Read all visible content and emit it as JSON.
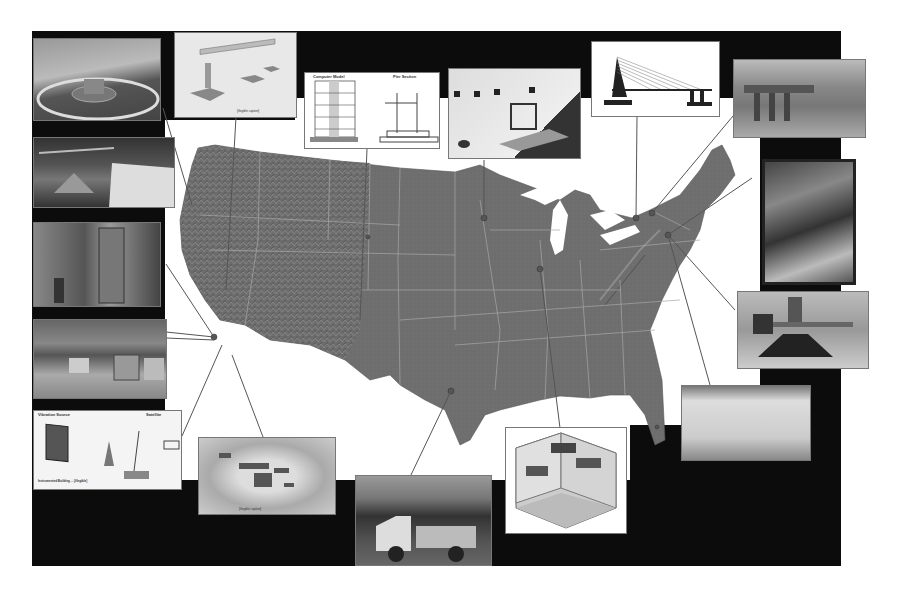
{
  "figure": {
    "type": "map-with-callouts",
    "colors": {
      "frame_background": "#0c0c0c",
      "map_land": "#6e6e6e",
      "state_borders": "#a8a8a8",
      "water_background": "#ffffff",
      "leader_lines": "#555555"
    }
  },
  "insets": [
    {
      "id": "tl-1",
      "kind": "photo",
      "description": "circular shake table / centrifuge facility",
      "label": ""
    },
    {
      "id": "tl-2",
      "kind": "diagram",
      "description": "bridge model on multiple shake tables",
      "label": "[illegible caption]"
    },
    {
      "id": "t-3",
      "kind": "diagram",
      "description": "Computer Model / Pier Section schematic",
      "label_left": "Computer Model",
      "label_right": "Pier Section"
    },
    {
      "id": "t-4",
      "kind": "diagram",
      "description": "reaction wall lab layout with test frame",
      "label": "[illegible caption]"
    },
    {
      "id": "t-5",
      "kind": "diagram",
      "description": "cable-stayed bridge elevation",
      "label": ""
    },
    {
      "id": "tr-6",
      "kind": "photo",
      "description": "structural test frame in laboratory",
      "label": ""
    },
    {
      "id": "r-7",
      "kind": "photo",
      "description": "large-scale lab specimen, overhead view",
      "label": ""
    },
    {
      "id": "r-8",
      "kind": "photo",
      "description": "actuator test rig",
      "label": ""
    },
    {
      "id": "r-9",
      "kind": "photo",
      "description": "strong wall with anchor grid",
      "label": ""
    },
    {
      "id": "l-10",
      "kind": "photo",
      "description": "centrifuge rotor arm",
      "label": ""
    },
    {
      "id": "l-11",
      "kind": "photo",
      "description": "test specimen in lab bay",
      "label": ""
    },
    {
      "id": "l-12",
      "kind": "photo",
      "description": "field test site with structures",
      "label": ""
    },
    {
      "id": "bl-13",
      "kind": "diagram",
      "description": "field instrumentation network",
      "label_left": "Vibration Source",
      "label_right": "Satellite",
      "label_bottom": "Instrumented Building ... [illegible]"
    },
    {
      "id": "b-14",
      "kind": "diagram",
      "description": "aerial sketch of facility site",
      "label": "[illegible caption]"
    },
    {
      "id": "b-15",
      "kind": "photo",
      "description": "mobile shaker trucks in the field",
      "label": ""
    },
    {
      "id": "b-16",
      "kind": "diagram",
      "description": "isometric lab with two shake tables and reaction walls",
      "label": ""
    }
  ]
}
